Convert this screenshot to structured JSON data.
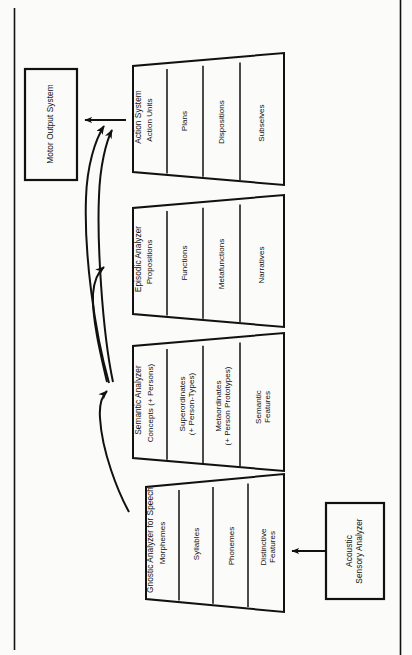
{
  "figure": {
    "type": "block-diagram",
    "orientation": "rotated-90-counterclockwise",
    "line_color": "#111111",
    "background_color": "#fbfbfa"
  },
  "boxes": [
    {
      "name": "motor-output-system",
      "label": "Motor Output System"
    },
    {
      "name": "acoustic-sensory-analyzer",
      "label": "Acoustic\nSensory Analyzer"
    }
  ],
  "modules": [
    {
      "name": "action-system",
      "title": "Action System",
      "cells": [
        "Action Units",
        "Plans",
        "Dispositions",
        "Subselves"
      ]
    },
    {
      "name": "episodic-analyzer",
      "title": "Episodic Analyzer",
      "cells": [
        "Propositions",
        "Functions",
        "Metafunctions",
        "Narratives"
      ]
    },
    {
      "name": "semantic-analyzer",
      "title": "Semantic Analyzer",
      "cells": [
        "Concepts (+ Persons)",
        "Superordinates\n(+ Person-Types)",
        "Metaordinates\n(+ Person Prototypes)",
        "Semantic\nFeatures"
      ]
    },
    {
      "name": "gnostic-analyzer-for-speech",
      "title": "Gnostic Analyzer for Speech",
      "cells": [
        "Morphemes",
        "Syllables",
        "Phonemes",
        "Distinctive\nFeatures"
      ]
    }
  ],
  "connections": [
    {
      "name": "acoustic-to-gnostic-arrow",
      "from": "acoustic-sensory-analyzer",
      "to": "gnostic-analyzer-for-speech",
      "style": "straight"
    },
    {
      "name": "gnostic-to-semantic-arrow",
      "from": "gnostic-analyzer-for-speech",
      "to": "semantic-analyzer",
      "style": "curved"
    },
    {
      "name": "semantic-to-episodic-arrow",
      "from": "semantic-analyzer",
      "to": "episodic-analyzer",
      "style": "curved"
    },
    {
      "name": "semantic-to-action-arrow",
      "from": "semantic-analyzer",
      "to": "action-system",
      "style": "curved"
    },
    {
      "name": "episodic-to-action-arrow",
      "from": "episodic-analyzer",
      "to": "action-system",
      "style": "curved"
    },
    {
      "name": "action-to-motor-arrow",
      "from": "action-system",
      "to": "motor-output-system",
      "style": "straight"
    }
  ],
  "page_rules": [
    {
      "name": "left-page-rule"
    },
    {
      "name": "right-page-rule"
    }
  ]
}
